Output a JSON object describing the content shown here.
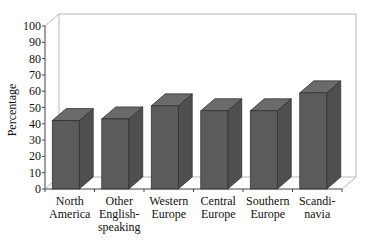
{
  "chart_data": {
    "type": "bar",
    "style": "3d-column",
    "title": "",
    "xlabel": "",
    "ylabel": "Percentage",
    "ylim": [
      0,
      100
    ],
    "yticks": [
      0,
      10,
      20,
      30,
      40,
      50,
      60,
      70,
      80,
      90,
      100
    ],
    "grid": false,
    "legend": null,
    "categories": [
      [
        "North",
        "America"
      ],
      [
        "Other",
        "English-",
        "speaking"
      ],
      [
        "Western",
        "Europe"
      ],
      [
        "Central",
        "Europe"
      ],
      [
        "Southern",
        "Europe"
      ],
      [
        "Scandi-",
        "navia"
      ]
    ],
    "category_names": [
      "North America",
      "Other English-speaking",
      "Western Europe",
      "Central Europe",
      "Southern Europe",
      "Scandinavia"
    ],
    "values": [
      42,
      43,
      51,
      48,
      48,
      59
    ],
    "colors": {
      "front": "#5b5b5b",
      "top": "#6a6a6a",
      "side": "#4f4f4f",
      "frame": "#b8b8b8",
      "axis": "#444444"
    }
  }
}
